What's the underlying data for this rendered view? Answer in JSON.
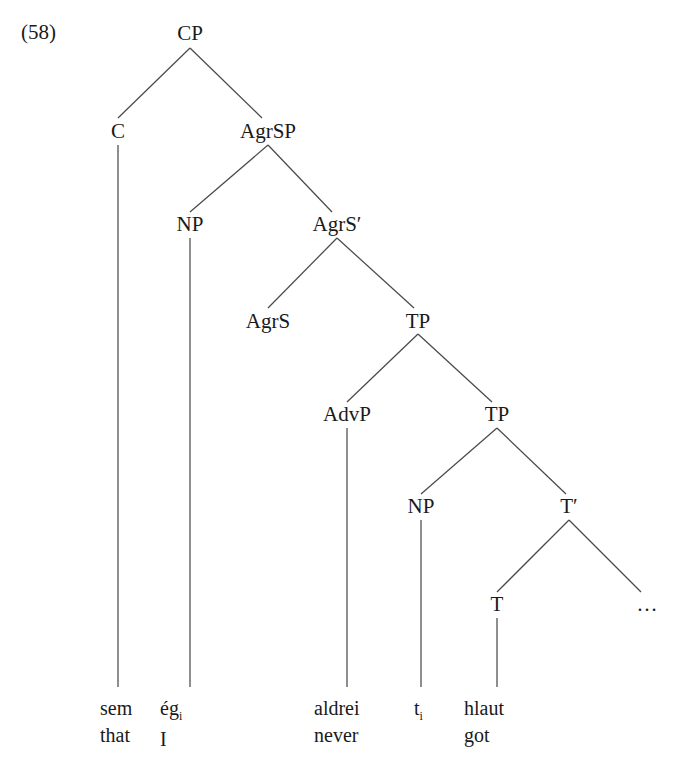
{
  "figure": {
    "example_number": "(58)",
    "type": "syntactic-tree-diagram",
    "line_color": "#4a4a4a",
    "background_color": "#ffffff",
    "text_color": "#1a1a1a"
  },
  "nodes": {
    "cp": "CP",
    "c": "C",
    "agrsp": "AgrSP",
    "np_subject": "NP",
    "agrs_bar": "AgrS′",
    "agrs": "AgrS",
    "tp_upper": "TP",
    "advp": "AdvP",
    "tp_lower": "TP",
    "np_trace": "NP",
    "t_bar": "T′",
    "t": "T",
    "ellipsis": "…"
  },
  "terminals": [
    {
      "id": "c-terminal",
      "word": "sem",
      "gloss": "that",
      "subscript": ""
    },
    {
      "id": "np-terminal",
      "word": "ég",
      "gloss": "I",
      "subscript": "i"
    },
    {
      "id": "advp-terminal",
      "word": "aldrei",
      "gloss": "never",
      "subscript": ""
    },
    {
      "id": "trace-terminal",
      "word": "t",
      "gloss": "",
      "subscript": "i"
    },
    {
      "id": "t-terminal",
      "word": "hlaut",
      "gloss": "got",
      "subscript": ""
    }
  ],
  "sentence": {
    "icelandic": "sem ég aldrei hlaut",
    "english": "that I never got"
  }
}
